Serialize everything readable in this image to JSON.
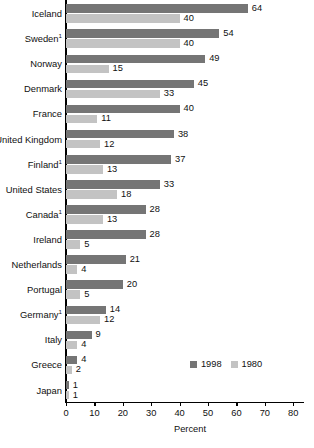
{
  "chart_data": {
    "type": "bar",
    "orientation": "horizontal",
    "title": "",
    "xlabel": "Percent",
    "ylabel": "",
    "xlim": [
      0,
      84
    ],
    "xticks": [
      0,
      10,
      20,
      30,
      40,
      50,
      60,
      70,
      80
    ],
    "grid": false,
    "legend_position": "bottom-right",
    "categories": [
      "Iceland",
      "Sweden¹",
      "Norway",
      "Denmark",
      "France",
      "United Kingdom",
      "Finland¹",
      "United States",
      "Canada¹",
      "Ireland",
      "Netherlands",
      "Portugal",
      "Germany¹",
      "Italy",
      "Greece",
      "Japan"
    ],
    "series": [
      {
        "name": "1998",
        "color": "#757575",
        "values": [
          64,
          54,
          49,
          45,
          40,
          38,
          37,
          33,
          28,
          28,
          21,
          20,
          14,
          9,
          4,
          1
        ]
      },
      {
        "name": "1980",
        "color": "#c3c3c3",
        "values": [
          40,
          40,
          15,
          33,
          11,
          12,
          13,
          18,
          13,
          5,
          4,
          5,
          12,
          4,
          2,
          1
        ]
      }
    ]
  }
}
